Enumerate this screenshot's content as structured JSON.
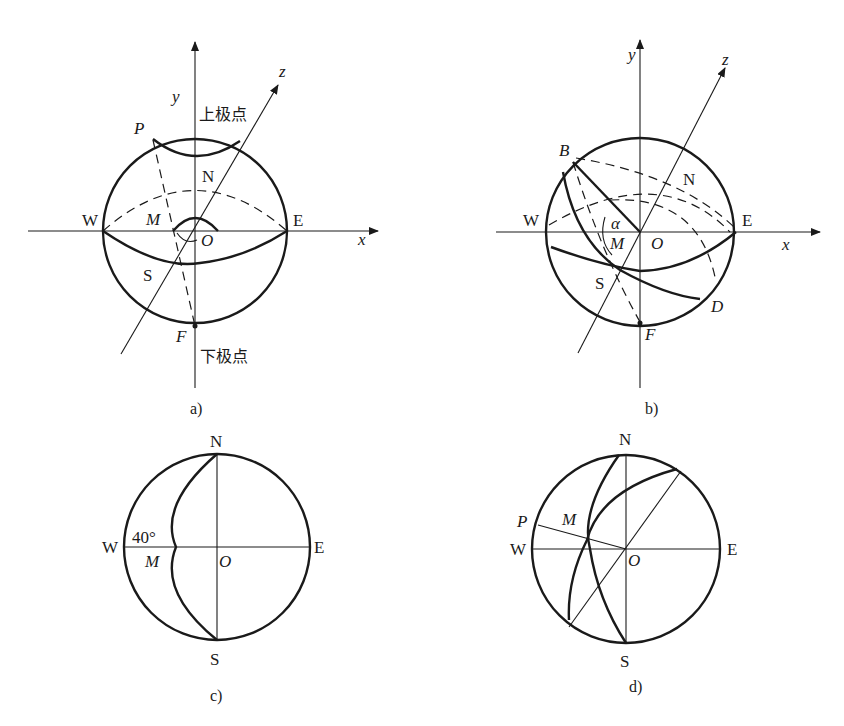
{
  "figures": {
    "a": {
      "caption": "a)",
      "axis_x": "x",
      "axis_y": "y",
      "axis_z": "z",
      "upper_pole": "上极点",
      "lower_pole": "下极点",
      "points": {
        "P": "P",
        "N": "N",
        "W": "W",
        "E": "E",
        "M": "M",
        "O": "O",
        "S": "S",
        "F": "F"
      }
    },
    "b": {
      "caption": "b)",
      "axis_x": "x",
      "axis_y": "y",
      "axis_z": "z",
      "points": {
        "B": "B",
        "N": "N",
        "W": "W",
        "E": "E",
        "alpha": "α",
        "M": "M",
        "O": "O",
        "S": "S",
        "D": "D",
        "F": "F"
      }
    },
    "c": {
      "caption": "c)",
      "angle": "40°",
      "points": {
        "N": "N",
        "W": "W",
        "E": "E",
        "M": "M",
        "O": "O",
        "S": "S"
      }
    },
    "d": {
      "caption": "d)",
      "points": {
        "N": "N",
        "P": "P",
        "M": "M",
        "W": "W",
        "E": "E",
        "O": "O",
        "S": "S"
      }
    }
  }
}
